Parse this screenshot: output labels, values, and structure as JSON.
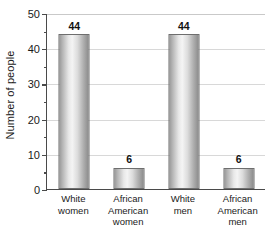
{
  "chart_data": {
    "type": "bar",
    "title": "",
    "subtitle": "",
    "xlabel": "",
    "ylabel": "Number of people",
    "categories": [
      "White women",
      "African American women",
      "White men",
      "African American men"
    ],
    "values": [
      44,
      6,
      44,
      6
    ],
    "value_labels": [
      "44",
      "6",
      "44",
      "6"
    ],
    "ylim": [
      0,
      50
    ],
    "y_major_ticks": [
      0,
      10,
      20,
      30,
      40,
      50
    ],
    "y_major_tick_labels": [
      "0",
      "10",
      "20",
      "30",
      "40",
      "50"
    ],
    "y_minor_ticks": [
      5,
      15,
      25,
      35,
      45
    ],
    "grid": true,
    "grid_axis": "y",
    "legend": false,
    "legend_position": "none",
    "bar_fill": "#e0e0e0",
    "bar_edge": "#6e6e6e",
    "grid_color": "#d8d8d8",
    "axis_color": "#4a4a4a",
    "background": "#ffffff",
    "text_color": "#1a1a1a"
  },
  "axes": {
    "y_title": "Number of people"
  },
  "category_label_lines": [
    [
      "White",
      "women"
    ],
    [
      "African",
      "American",
      "women"
    ],
    [
      "White",
      "men"
    ],
    [
      "African",
      "American",
      "men"
    ]
  ]
}
